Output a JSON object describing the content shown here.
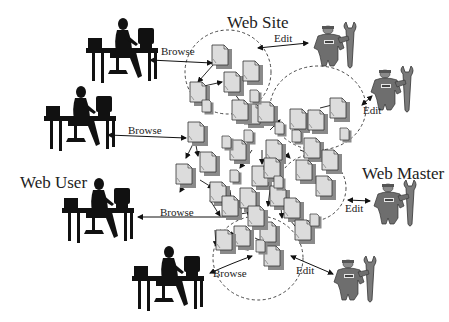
{
  "diagram": {
    "title_labels": {
      "web_site": "Web Site",
      "web_user": "Web User",
      "web_master": "Web Master"
    },
    "actions": {
      "browse": [
        "Browse",
        "Browse",
        "Browse",
        "Browse"
      ],
      "edit": [
        "Edit",
        "Edit",
        "Edit",
        "Edit"
      ]
    },
    "actors": {
      "web_users": [
        {
          "id": "user-1",
          "icon": "person-at-computer-icon"
        },
        {
          "id": "user-2",
          "icon": "person-at-computer-icon"
        },
        {
          "id": "user-3",
          "icon": "person-at-computer-icon"
        },
        {
          "id": "user-4",
          "icon": "person-at-computer-icon"
        }
      ],
      "web_masters": [
        {
          "id": "master-1",
          "icon": "worker-with-wrench-icon"
        },
        {
          "id": "master-2",
          "icon": "worker-with-wrench-icon"
        },
        {
          "id": "master-3",
          "icon": "worker-with-wrench-icon"
        },
        {
          "id": "master-4",
          "icon": "worker-with-wrench-icon"
        }
      ]
    },
    "site_node_icon": "web-page-document-icon",
    "colors": {
      "ink": "#111111",
      "page_fill": "#dcdcdc",
      "page_shadow": "#8a8a8a",
      "master_fill": "#6e6e6e"
    }
  }
}
